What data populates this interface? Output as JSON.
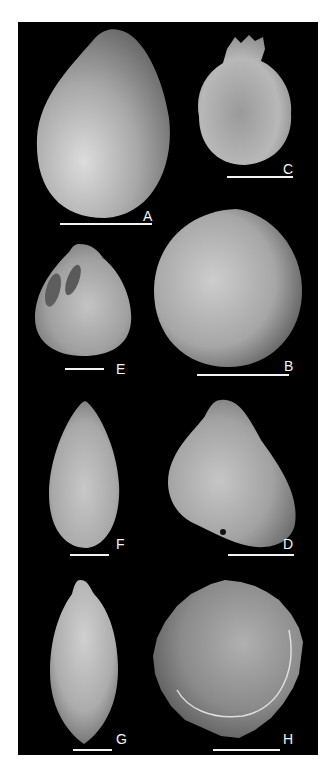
{
  "figure": {
    "background": "#000000",
    "page_background": "#ffffff",
    "panels": [
      {
        "id": "A",
        "label": "A",
        "shape": "ovate",
        "tone": "#bdbdbd"
      },
      {
        "id": "B",
        "label": "B",
        "shape": "spherical",
        "tone": "#b4b4b4"
      },
      {
        "id": "C",
        "label": "C",
        "shape": "flask-rough",
        "tone": "#a8a8a8"
      },
      {
        "id": "D",
        "label": "D",
        "shape": "pyriform",
        "tone": "#b8b8b8"
      },
      {
        "id": "E",
        "label": "E",
        "shape": "ovate-with-pits",
        "tone": "#b0b0b0"
      },
      {
        "id": "F",
        "label": "F",
        "shape": "elongate",
        "tone": "#bcbcbc"
      },
      {
        "id": "G",
        "label": "G",
        "shape": "fusiform",
        "tone": "#c0c0c0"
      },
      {
        "id": "H",
        "label": "H",
        "shape": "disc-cup",
        "tone": "#8e8e8e"
      }
    ]
  }
}
